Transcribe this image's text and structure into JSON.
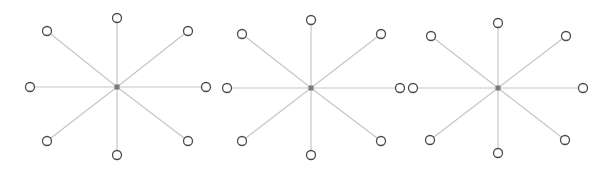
{
  "diagram": {
    "type": "star-graphs",
    "colors": {
      "background": "#ffffff",
      "edge": "#c6c6c6",
      "node_stroke": "#4a4a4a",
      "node_fill": "#ffffff",
      "hub": "#7a7a7a"
    },
    "node_radius": 4.5,
    "stars": [
      {
        "center": [
          117,
          87
        ],
        "leaves": [
          [
            117,
            18
          ],
          [
            188,
            31
          ],
          [
            206,
            87
          ],
          [
            188,
            141
          ],
          [
            117,
            155
          ],
          [
            47,
            141
          ],
          [
            30,
            87
          ],
          [
            47,
            31
          ]
        ]
      },
      {
        "center": [
          311,
          88
        ],
        "leaves": [
          [
            311,
            20
          ],
          [
            381,
            34
          ],
          [
            400,
            88
          ],
          [
            381,
            141
          ],
          [
            311,
            155
          ],
          [
            242,
            141
          ],
          [
            227,
            88
          ],
          [
            242,
            34
          ]
        ]
      },
      {
        "center": [
          498,
          88
        ],
        "leaves": [
          [
            498,
            23
          ],
          [
            566,
            36
          ],
          [
            583,
            88
          ],
          [
            565,
            140
          ],
          [
            498,
            153
          ],
          [
            430,
            140
          ],
          [
            413,
            88
          ],
          [
            431,
            36
          ]
        ]
      }
    ]
  }
}
